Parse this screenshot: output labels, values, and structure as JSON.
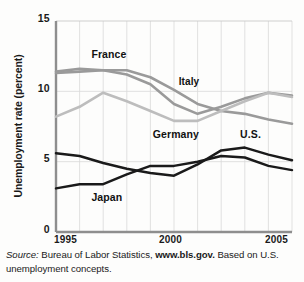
{
  "figure": {
    "ylabel": "Unemployment rate (percent)",
    "y_ticks": [
      "0",
      "5",
      "10",
      "15"
    ],
    "x_ticks": [
      "1995",
      "2000",
      "2005"
    ],
    "source": {
      "label": "Source:",
      "text_before": " Bureau of Labor Statistics, ",
      "link": "www.bls.gov.",
      "text_after": " Based on U.S. unemployment concepts."
    },
    "labels": {
      "france": "France",
      "italy": "Italy",
      "germany": "Germany",
      "us": "U.S.",
      "japan": "Japan"
    }
  },
  "chart_data": {
    "type": "line",
    "title": "",
    "xlabel": "",
    "ylabel": "Unemployment rate (percent)",
    "xlim": [
      1995,
      2005
    ],
    "ylim": [
      0,
      15
    ],
    "y_ticks": [
      0,
      5,
      10,
      15
    ],
    "x_ticks": [
      1995,
      2000,
      2005
    ],
    "grid": "both",
    "legend": "inline-annotations",
    "x": [
      1995,
      1996,
      1997,
      1998,
      1999,
      2000,
      2001,
      2002,
      2003,
      2004,
      2005
    ],
    "series": [
      {
        "name": "France",
        "color": "#9a9a9a",
        "values": [
          11.4,
          11.6,
          11.5,
          11.2,
          10.5,
          9.1,
          8.4,
          8.9,
          9.5,
          9.9,
          9.7
        ]
      },
      {
        "name": "Italy",
        "color": "#9a9a9a",
        "values": [
          11.3,
          11.4,
          11.5,
          11.5,
          11.0,
          10.1,
          9.1,
          8.6,
          8.4,
          8.0,
          7.7
        ]
      },
      {
        "name": "Germany",
        "color": "#bdbdbd",
        "values": [
          8.2,
          8.9,
          9.9,
          9.3,
          8.6,
          7.9,
          7.9,
          8.6,
          9.3,
          9.9,
          9.6
        ]
      },
      {
        "name": "U.S.",
        "color": "#1a1a1a",
        "values": [
          5.6,
          5.4,
          4.9,
          4.5,
          4.2,
          4.0,
          4.8,
          5.8,
          6.0,
          5.5,
          5.1
        ]
      },
      {
        "name": "Japan",
        "color": "#1a1a1a",
        "values": [
          3.1,
          3.4,
          3.4,
          4.1,
          4.7,
          4.7,
          5.0,
          5.4,
          5.3,
          4.7,
          4.4
        ]
      }
    ],
    "annotations": [
      {
        "text": "France",
        "x": 1996.5,
        "y": 12.6
      },
      {
        "text": "Italy",
        "x": 2000.2,
        "y": 10.6
      },
      {
        "text": "Germany",
        "x": 1999.1,
        "y": 6.9
      },
      {
        "text": "U.S.",
        "x": 2002.8,
        "y": 6.9
      },
      {
        "text": "Japan",
        "x": 1996.5,
        "y": 2.4
      }
    ]
  }
}
